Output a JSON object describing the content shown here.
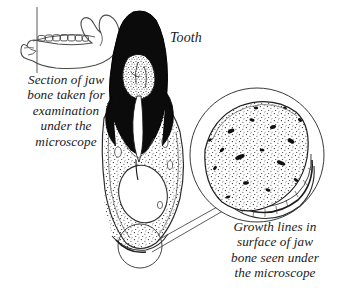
{
  "figure": {
    "background_color": "#ffffff",
    "ink_color": "#1a1a1a",
    "style": "pen-and-ink scientific illustration"
  },
  "captions": {
    "jaw_section": "Section of jaw\nbone taken for\nexamination\nunder the\nmicroscope",
    "tooth": "Tooth",
    "growth_lines": "Growth lines in\nsurface of jaw\nbone seen under\nthe microscope"
  },
  "parts": {
    "mandible": {
      "name": "jaw bone outline with tooth row",
      "section_line": "vertical cut line through the jaw"
    },
    "tooth_section": {
      "name": "vertical section through tooth and jaw bone",
      "crown": "solid black enamel crown",
      "pulp": "stippled pulp chamber",
      "root_canal": "white root canal",
      "bone": "stippled jaw bone",
      "cavity": "large white marrow cavity",
      "detail_circle": "small circle marking magnified surface region"
    },
    "inset": {
      "name": "magnified circular view of jaw bone surface",
      "block": "stippled bone block with dark speckles",
      "growth_lines": "layered striations along lower edge"
    },
    "leader_lines": "two lines linking the marked region to the magnified circle"
  }
}
